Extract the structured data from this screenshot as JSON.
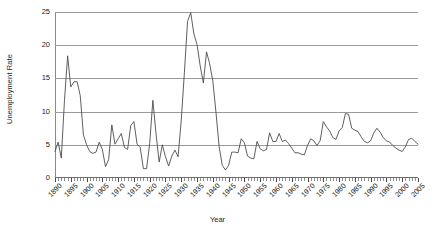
{
  "chart_data": {
    "type": "line",
    "title": "",
    "xlabel": "Year",
    "ylabel": "Unemployment Rate",
    "xlim": [
      1890,
      2005
    ],
    "ylim": [
      0,
      25
    ],
    "yticks": [
      0,
      5,
      10,
      15,
      20,
      25
    ],
    "xticks": [
      1890,
      1895,
      1900,
      1905,
      1910,
      1915,
      1920,
      1925,
      1930,
      1935,
      1940,
      1945,
      1950,
      1955,
      1960,
      1965,
      1970,
      1975,
      1980,
      1985,
      1990,
      1995,
      2000,
      2005
    ],
    "grid": true,
    "legend": false,
    "line_color": "#4d4d4d",
    "grid_color": "#9a9a9a",
    "background": "#ffffff",
    "series": [
      {
        "name": "Unemployment Rate",
        "x": [
          1890,
          1891,
          1892,
          1893,
          1894,
          1895,
          1896,
          1897,
          1898,
          1899,
          1900,
          1901,
          1902,
          1903,
          1904,
          1905,
          1906,
          1907,
          1908,
          1909,
          1910,
          1911,
          1912,
          1913,
          1914,
          1915,
          1916,
          1917,
          1918,
          1919,
          1920,
          1921,
          1922,
          1923,
          1924,
          1925,
          1926,
          1927,
          1928,
          1929,
          1930,
          1931,
          1932,
          1933,
          1934,
          1935,
          1936,
          1937,
          1938,
          1939,
          1940,
          1941,
          1942,
          1943,
          1944,
          1945,
          1946,
          1947,
          1948,
          1949,
          1950,
          1951,
          1952,
          1953,
          1954,
          1955,
          1956,
          1957,
          1958,
          1959,
          1960,
          1961,
          1962,
          1963,
          1964,
          1965,
          1966,
          1967,
          1968,
          1969,
          1970,
          1971,
          1972,
          1973,
          1974,
          1975,
          1976,
          1977,
          1978,
          1979,
          1980,
          1981,
          1982,
          1983,
          1984,
          1985,
          1986,
          1987,
          1988,
          1989,
          1990,
          1991,
          1992,
          1993,
          1994,
          1995,
          1996,
          1997,
          1998,
          1999,
          2000,
          2001,
          2002,
          2003,
          2004,
          2005
        ],
        "values": [
          4.0,
          5.4,
          3.0,
          11.7,
          18.4,
          13.7,
          14.5,
          14.5,
          12.4,
          6.5,
          5.0,
          4.0,
          3.7,
          3.9,
          5.4,
          4.3,
          1.7,
          2.8,
          8.0,
          5.1,
          5.9,
          6.7,
          4.6,
          4.3,
          7.9,
          8.5,
          5.1,
          4.6,
          1.4,
          1.4,
          5.2,
          11.7,
          6.7,
          2.4,
          5.0,
          3.2,
          1.8,
          3.3,
          4.2,
          3.2,
          8.7,
          15.9,
          23.6,
          24.9,
          21.7,
          20.1,
          16.9,
          14.3,
          19.0,
          17.2,
          14.6,
          9.9,
          4.7,
          1.9,
          1.2,
          1.9,
          3.9,
          3.9,
          3.8,
          5.9,
          5.3,
          3.3,
          3.0,
          2.9,
          5.5,
          4.4,
          4.1,
          4.3,
          6.8,
          5.5,
          5.5,
          6.7,
          5.5,
          5.7,
          5.2,
          4.5,
          3.8,
          3.8,
          3.6,
          3.5,
          4.9,
          5.9,
          5.6,
          4.9,
          5.6,
          8.5,
          7.7,
          7.1,
          6.1,
          5.8,
          7.1,
          7.6,
          9.7,
          9.6,
          7.5,
          7.2,
          7.0,
          6.2,
          5.5,
          5.3,
          5.6,
          6.8,
          7.5,
          6.9,
          6.1,
          5.6,
          5.4,
          4.9,
          4.5,
          4.2,
          4.0,
          4.7,
          5.8,
          6.0,
          5.5,
          5.1
        ]
      }
    ]
  }
}
